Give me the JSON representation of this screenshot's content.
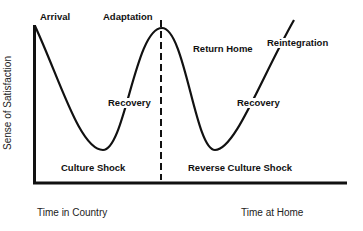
{
  "diagram": {
    "y_axis_label": "Sense of Satisfaction",
    "x_axis_labels": [
      "Time in Country",
      "Time at Home"
    ],
    "stage_labels": {
      "arrival": "Arrival",
      "adaptation": "Adaptation",
      "recovery_1": "Recovery",
      "culture_shock": "Culture Shock",
      "return_home": "Return Home",
      "reintegration": "Reintegration",
      "recovery_2": "Recovery",
      "reverse_culture_shock": "Reverse Culture Shock"
    },
    "colors": {
      "line": "#111111",
      "background": "#ffffff"
    }
  }
}
